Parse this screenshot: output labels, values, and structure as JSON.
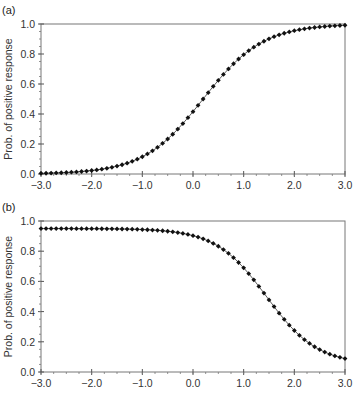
{
  "chart_data": [
    {
      "type": "scatter",
      "panel_label": "(a)",
      "title": "",
      "xlabel": "",
      "ylabel": "Prob. of positive response",
      "xlim": [
        -3.0,
        3.0
      ],
      "ylim": [
        0.0,
        1.0
      ],
      "x_ticks": [
        "-3.0",
        "-2.0",
        "-1.0",
        "0.0",
        "1.0",
        "2.0",
        "3.0"
      ],
      "y_ticks": [
        "0.0",
        "0.2",
        "0.4",
        "0.6",
        "0.8",
        "1.0"
      ],
      "grid": false,
      "legend": null,
      "series": [
        {
          "name": "curve-a",
          "marker": "diamond",
          "color": "#111111",
          "x_start": -3.0,
          "x_end": 3.0,
          "x_step": 0.1,
          "model": {
            "kind": "logistic",
            "lower": 0.0,
            "upper": 1.0,
            "center": 0.2,
            "slope": 1.7
          },
          "sample_values": {
            "-3.0": 0.0,
            "-2.0": 0.01,
            "-1.0": 0.12,
            "0.0": 0.4,
            "1.0": 0.8,
            "2.0": 0.97,
            "3.0": 1.0
          }
        }
      ]
    },
    {
      "type": "scatter",
      "panel_label": "(b)",
      "title": "",
      "xlabel": "",
      "ylabel": "Prob. of positive response",
      "xlim": [
        -3.0,
        3.0
      ],
      "ylim": [
        0.0,
        1.0
      ],
      "x_ticks": [
        "-3.0",
        "-2.0",
        "-1.0",
        "0.0",
        "1.0",
        "2.0",
        "3.0"
      ],
      "y_ticks": [
        "0.0",
        "0.2",
        "0.4",
        "0.6",
        "0.8",
        "1.0"
      ],
      "grid": false,
      "legend": null,
      "series": [
        {
          "name": "curve-b",
          "marker": "diamond",
          "color": "#111111",
          "x_start": -3.0,
          "x_end": 3.0,
          "x_step": 0.1,
          "model": {
            "kind": "logistic-decreasing",
            "lower": 0.05,
            "upper": 0.95,
            "center": 1.45,
            "slope": 2.0
          },
          "sample_values": {
            "-3.0": 0.95,
            "-2.0": 0.95,
            "-1.0": 0.94,
            "0.0": 0.9,
            "1.0": 0.62,
            "2.0": 0.2,
            "3.0": 0.08
          }
        }
      ]
    }
  ]
}
